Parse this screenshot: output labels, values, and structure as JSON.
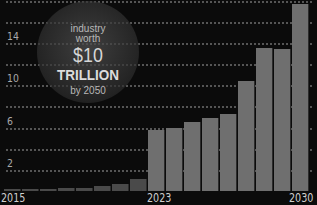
{
  "chart_data": {
    "type": "bar",
    "title": "",
    "xlabel": "",
    "ylabel": "",
    "ylim": [
      0,
      18
    ],
    "yticks": [
      2,
      6,
      10,
      14
    ],
    "grid": true,
    "x_tick_labels": [
      "2015",
      "2023",
      "2030"
    ],
    "categories": [
      "2015",
      "",
      "",
      "",
      "",
      "",
      "",
      "",
      "2023",
      "",
      "",
      "",
      "",
      "",
      "",
      "",
      "2030"
    ],
    "values": [
      0.2,
      0.2,
      0.2,
      0.3,
      0.3,
      0.5,
      0.7,
      1.1,
      5.8,
      6.0,
      6.5,
      6.9,
      7.3,
      10.4,
      13.5,
      13.4,
      17.7
    ],
    "annotation": {
      "line1": "industry",
      "line2": "worth",
      "amount": "$10",
      "unit": "TRILLION",
      "line5": "by 2050"
    }
  },
  "axis": {
    "y_labels": [
      {
        "text": "14",
        "y": 43
      },
      {
        "text": "10",
        "y": 85
      },
      {
        "text": "6",
        "y": 128
      },
      {
        "text": "2",
        "y": 170
      }
    ],
    "x_labels": [
      {
        "text": "2015",
        "x": 1
      },
      {
        "text": "2023",
        "x": 147
      },
      {
        "text": "2030",
        "x": 289
      }
    ]
  }
}
